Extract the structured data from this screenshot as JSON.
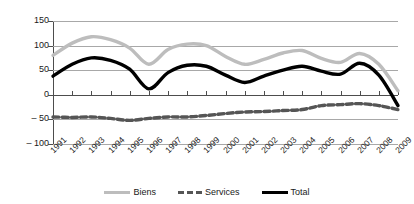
{
  "chart_data": {
    "type": "line",
    "title": "",
    "subtitle": "",
    "xlabel": "",
    "ylabel": "",
    "ylim": [
      -100,
      150
    ],
    "yticks": [
      150,
      100,
      50,
      0,
      -50,
      -100
    ],
    "ytick_labels": [
      "150",
      "100",
      "50",
      "0",
      "– 50",
      "– 100"
    ],
    "grid": true,
    "legend_position": "bottom",
    "categories": [
      "1991",
      "1992",
      "1993",
      "1994",
      "1995",
      "1996",
      "1997",
      "1998",
      "1999",
      "2000",
      "2001",
      "2002",
      "2003",
      "2004",
      "2005",
      "2006",
      "2007",
      "2008",
      "2009"
    ],
    "series": [
      {
        "name": "Biens",
        "color": "#bdbdbd",
        "style": "solid",
        "values": [
          80,
          105,
          118,
          112,
          95,
          62,
          92,
          103,
          100,
          78,
          62,
          72,
          85,
          90,
          74,
          66,
          84,
          62,
          8
        ]
      },
      {
        "name": "Services",
        "color": "#555555",
        "style": "dashed",
        "values": [
          -45,
          -46,
          -45,
          -48,
          -52,
          -48,
          -45,
          -45,
          -42,
          -38,
          -35,
          -34,
          -32,
          -30,
          -22,
          -20,
          -18,
          -22,
          -30
        ]
      },
      {
        "name": "Total",
        "color": "#000000",
        "style": "solid",
        "values": [
          38,
          62,
          75,
          70,
          52,
          12,
          45,
          60,
          58,
          40,
          25,
          38,
          50,
          58,
          48,
          42,
          64,
          40,
          -22
        ]
      }
    ]
  },
  "legend": {
    "items": [
      {
        "label": "Biens",
        "swatch": "line-solid-gray-swatch"
      },
      {
        "label": "Services",
        "swatch": "line-dashed-darkgray-swatch"
      },
      {
        "label": "Total",
        "swatch": "line-solid-black-swatch"
      }
    ]
  }
}
